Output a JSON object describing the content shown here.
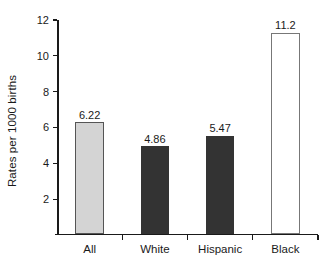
{
  "chart_data": {
    "type": "bar",
    "title": "",
    "subtitle": "",
    "xlabel": "",
    "ylabel": "Rates per 1000 births",
    "categories": [
      "All",
      "White",
      "Hispanic",
      "Black"
    ],
    "values": [
      6.22,
      4.86,
      5.47,
      11.2
    ],
    "value_labels": [
      "6.22",
      "4.86",
      "5.47",
      "11.2"
    ],
    "bar_colors": [
      "#d4d4d4",
      "#333333",
      "#333333",
      "#ffffff"
    ],
    "bar_edge_colors": [
      "#555555",
      "#333333",
      "#333333",
      "#777777"
    ],
    "ylim": [
      0,
      12
    ],
    "yticks": [
      2,
      4,
      6,
      8,
      10,
      12
    ],
    "ytick_labels": [
      "2",
      "4",
      "6",
      "8",
      "10",
      "12"
    ],
    "grid": false,
    "legend": null,
    "annotations": []
  },
  "axis": {
    "y_title": "Rates per 1000 births"
  }
}
